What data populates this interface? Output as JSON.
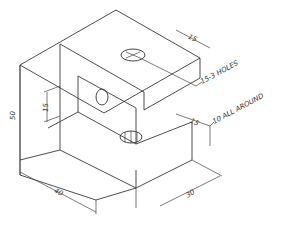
{
  "drawing": {
    "type": "isometric-part-drawing",
    "part": "bracket",
    "colors": {
      "line": "#3a3a3a",
      "background": "#ffffff"
    },
    "dimensions": {
      "total_height": "50",
      "slot_height": "15",
      "depth": "40",
      "width": "30",
      "top_flange_thickness": "15",
      "bottom_flange_thickness": "15"
    },
    "notes": {
      "holes": "15-3 HOLES",
      "thickness": "10 ALL AROUND"
    },
    "holes": [
      {
        "location": "top-face"
      },
      {
        "location": "inner-wall"
      },
      {
        "location": "bottom-face"
      }
    ]
  }
}
